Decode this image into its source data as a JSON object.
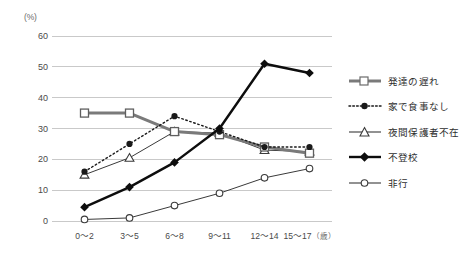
{
  "chart_data": {
    "type": "line",
    "title": "",
    "xlabel": "",
    "ylabel": "(%)",
    "yunit": "(%)",
    "ylim": [
      0,
      60
    ],
    "ytick_labels": [
      "0",
      "10",
      "20",
      "30",
      "40",
      "50",
      "60"
    ],
    "ytick_values": [
      0,
      10,
      20,
      30,
      40,
      50,
      60
    ],
    "grid": true,
    "grid_axis": "y",
    "legend_position": "right",
    "categories": [
      "0～2",
      "3～5",
      "6～8",
      "9～11",
      "12～14",
      "15～17"
    ],
    "category_unit": "（歳）",
    "series": [
      {
        "name": "発達の遅れ",
        "values": [
          35,
          35,
          29,
          28,
          24,
          22
        ],
        "color": "#7a7a7a",
        "marker": "open-square",
        "line_style": "solid",
        "line_width": 3
      },
      {
        "name": "家で食事なし",
        "values": [
          16,
          25,
          34,
          29,
          24,
          24
        ],
        "color": "#1a1a1a",
        "marker": "filled-circle",
        "line_style": "dotted",
        "line_width": 1.4
      },
      {
        "name": "夜間保護者不在",
        "values": [
          15,
          20.5,
          29,
          28.5,
          23,
          22.5
        ],
        "color": "#3a3a3a",
        "marker": "open-triangle",
        "line_style": "solid",
        "line_width": 1
      },
      {
        "name": "不登校",
        "values": [
          4.5,
          11,
          19,
          30,
          51,
          48
        ],
        "color": "#0d0d0d",
        "marker": "filled-diamond",
        "line_style": "solid",
        "line_width": 2.4
      },
      {
        "name": "非行",
        "values": [
          0.5,
          1,
          5,
          9,
          14,
          17
        ],
        "color": "#3a3a3a",
        "marker": "open-circle",
        "line_style": "solid",
        "line_width": 1
      }
    ]
  },
  "legend": {
    "items": [
      {
        "label": "発達の遅れ"
      },
      {
        "label": "家で食事なし"
      },
      {
        "label": "夜間保護者不在"
      },
      {
        "label": "不登校"
      },
      {
        "label": "非行"
      }
    ]
  },
  "colors": {
    "grid": "#c9c9c9",
    "text": "#3a3a3a",
    "background": "#ffffff"
  }
}
